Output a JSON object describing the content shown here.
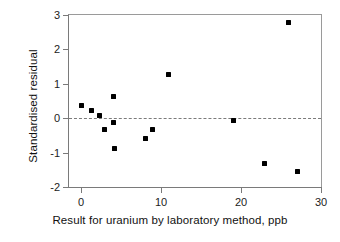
{
  "chart_data": {
    "type": "scatter",
    "title": "",
    "xlabel": "Result for uranium by laboratory method, ppb",
    "ylabel": "Standardised residual",
    "xlim": [
      -1.5,
      30
    ],
    "ylim": [
      -2,
      3
    ],
    "xticks": [
      0,
      10,
      20,
      30
    ],
    "xtick_labels": [
      "0",
      "10",
      "20",
      "30"
    ],
    "yticks": [
      -2,
      -1,
      0,
      1,
      2,
      3
    ],
    "ytick_labels": [
      "-2",
      "-1",
      "0",
      "1",
      "2",
      "3"
    ],
    "grid": false,
    "legend": "none",
    "reference_line": {
      "orientation": "horizontal",
      "value": 0,
      "style": "dashed",
      "color": "#7b7b7b"
    },
    "marker": {
      "shape": "square",
      "color": "#000000",
      "size": 5
    },
    "points": [
      {
        "x": 0.1,
        "y": 0.36
      },
      {
        "x": 1.3,
        "y": 0.21
      },
      {
        "x": 2.3,
        "y": 0.09
      },
      {
        "x": 2.9,
        "y": -0.33
      },
      {
        "x": 4.1,
        "y": 0.63
      },
      {
        "x": 4.1,
        "y": -0.12
      },
      {
        "x": 4.2,
        "y": -0.87
      },
      {
        "x": 8.0,
        "y": -0.58
      },
      {
        "x": 8.9,
        "y": -0.33
      },
      {
        "x": 10.9,
        "y": 1.27
      },
      {
        "x": 19.0,
        "y": -0.06
      },
      {
        "x": 22.9,
        "y": -1.33
      },
      {
        "x": 25.9,
        "y": 2.77
      },
      {
        "x": 27.1,
        "y": -1.56
      }
    ]
  },
  "colors": {
    "marker": "#000000",
    "axis": "#7a7a7a",
    "reference_line": "#7b7b7b",
    "background": "#ffffff",
    "text": "#111111"
  }
}
